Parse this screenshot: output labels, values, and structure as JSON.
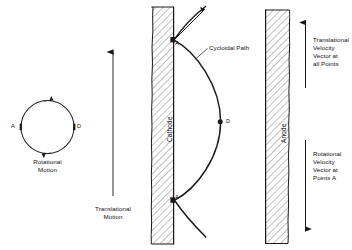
{
  "figure": {
    "type": "physics-schematic",
    "background": "#ffffff",
    "ink": "#111111",
    "hatch_color": "#8a8a8a"
  },
  "rotational": {
    "circle_label_line1": "Rotational",
    "circle_label_line2": "Motion",
    "point_left": "A",
    "point_right": "D"
  },
  "translational": {
    "label_line1": "Translational",
    "label_line2": "Motion"
  },
  "electrodes": {
    "cathode_label": "Cathode",
    "anode_label": "Anode"
  },
  "path": {
    "label": "Cycloidal Path",
    "cusp_upper_label": "A",
    "cusp_lower_label": "A",
    "mid_point_label": "D"
  },
  "annotations": {
    "translational_velocity": "Translational\nVelocity\nVector at\nall Points",
    "translational_velocity_lines": [
      "Translational",
      "Velocity",
      "Vector at",
      "all Points"
    ],
    "rotational_velocity": "Rotational\nVelocity\nVector at\nPoints A",
    "rotational_velocity_lines": [
      "Rotational",
      "Velocity",
      "Vector at",
      "Points A"
    ]
  }
}
